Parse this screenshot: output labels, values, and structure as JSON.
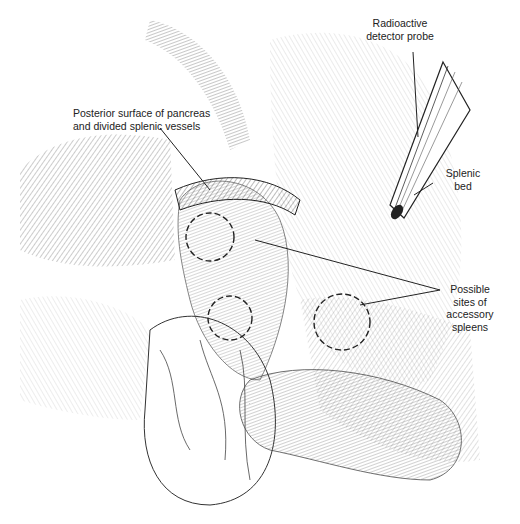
{
  "figure": {
    "type": "surgical illustration",
    "labels": {
      "probe": [
        "Radioactive",
        "detector probe"
      ],
      "pancreas": [
        "Posterior surface of pancreas",
        "and divided splenic vessels"
      ],
      "splenic_bed": [
        "Splenic",
        "bed"
      ],
      "accessory": [
        "Possible",
        "sites of",
        "accessory",
        "spleens"
      ]
    },
    "colors": {
      "ink": "#222222",
      "background": "#ffffff"
    }
  }
}
